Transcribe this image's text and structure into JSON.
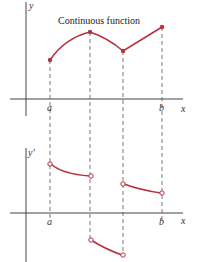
{
  "top_graph": {
    "title": "Continuous function",
    "y_label": "y",
    "x_label": "x",
    "a_label": "a",
    "b_label": "b"
  },
  "bottom_graph": {
    "y_label": "y'",
    "x_label": "x",
    "a_label": "a",
    "b_label": "b"
  },
  "colors": {
    "curve": "#b5323f",
    "axis": "#444444",
    "dash": "#555555"
  }
}
